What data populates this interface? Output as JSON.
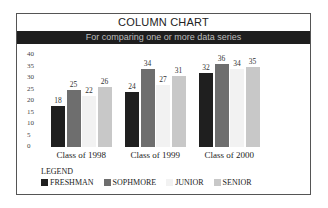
{
  "chart_data": {
    "type": "bar",
    "title": "COLUMN CHART",
    "subtitle": "For comparing one or more data series",
    "categories": [
      "Class of 1998",
      "Class of 1999",
      "Class of 2000"
    ],
    "series": [
      {
        "name": "FRESHMAN",
        "values": [
          18,
          24,
          32
        ],
        "color": "#1f1f1f"
      },
      {
        "name": "SOPHMORE",
        "values": [
          25,
          34,
          36
        ],
        "color": "#6e6e6e"
      },
      {
        "name": "JUNIOR",
        "values": [
          22,
          27,
          34
        ],
        "color": "#f2f2f2"
      },
      {
        "name": "SENIOR",
        "values": [
          26,
          31,
          35
        ],
        "color": "#c8c8c8"
      }
    ],
    "xlabel": "",
    "ylabel": "",
    "yticks": [
      0,
      5,
      10,
      15,
      20,
      25,
      30,
      35,
      40
    ],
    "ylim": [
      0,
      40
    ],
    "grid": false,
    "legend_position": "bottom-left",
    "legend_title": "LEGEND"
  }
}
